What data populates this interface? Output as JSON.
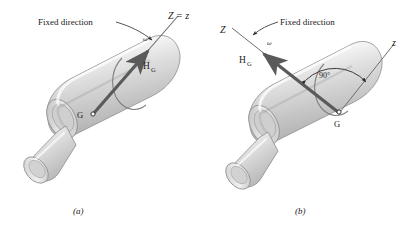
{
  "figure": {
    "type": "engineering-diagram",
    "background_color": "#ffffff",
    "body_color": "#d8d8d8",
    "body_outline_color": "#8a8a8a",
    "vector_color": "#5a5a5a",
    "leader_color": "#2a2a2a",
    "text_color": "#1a1a1a"
  },
  "panels": [
    {
      "id": "a",
      "caption": "(a)",
      "labels": {
        "fixed_direction": "Fixed direction",
        "axis": "Z = z",
        "omega": "ω",
        "momentum": "H",
        "momentum_sub": "G",
        "center_of_mass": "G"
      }
    },
    {
      "id": "b",
      "caption": "(b)",
      "labels": {
        "fixed_direction": "Fixed direction",
        "axis_capital": "Z",
        "axis_lower": "z",
        "omega": "ω",
        "momentum": "H",
        "momentum_sub": "G",
        "angle": "90°",
        "center_of_mass": "G"
      }
    }
  ]
}
